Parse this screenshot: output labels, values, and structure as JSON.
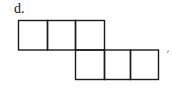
{
  "label": "d.",
  "diagram": {
    "type": "net-of-squares",
    "rows": [
      {
        "row": 1,
        "squares": 3,
        "columns": [
          1,
          2,
          3
        ]
      },
      {
        "row": 2,
        "squares": 3,
        "columns": [
          3,
          4,
          5
        ]
      }
    ],
    "total_squares": 6,
    "stroke_color": "#1a1a1a",
    "background_color": "#ffffff"
  },
  "trailing_mark": "'"
}
